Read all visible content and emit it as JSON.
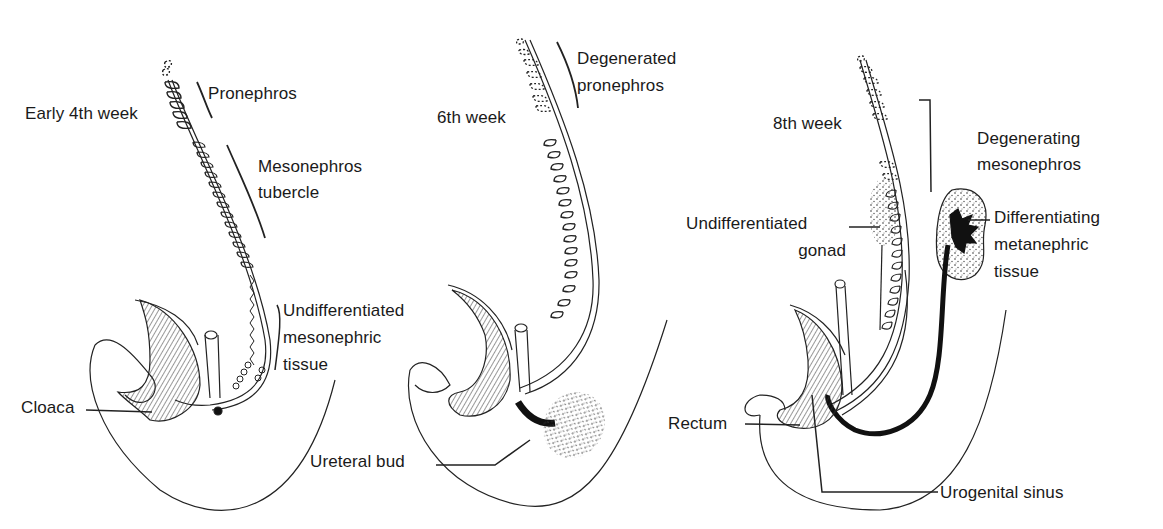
{
  "panels": [
    {
      "title": "Early 4th week",
      "labels": {
        "pronephros": "Pronephros",
        "mesonephros_1": "Mesonephros",
        "mesonephros_2": "tubercle",
        "undiff_1": "Undifferentiated",
        "undiff_2": "mesonephric",
        "undiff_3": "tissue",
        "cloaca": "Cloaca"
      }
    },
    {
      "title": "6th week",
      "labels": {
        "degen_1": "Degenerated",
        "degen_2": "pronephros",
        "ureteral_bud": "Ureteral bud"
      }
    },
    {
      "title": "8th week",
      "labels": {
        "degmeso_1": "Degenerating",
        "degmeso_2": "mesonephros",
        "gonad_1": "Undifferentiated",
        "gonad_2": "gonad",
        "meta_1": "Differentiating",
        "meta_2": "metanephric",
        "meta_3": "tissue",
        "rectum": "Rectum",
        "urogenital": "Urogenital sinus"
      }
    }
  ]
}
